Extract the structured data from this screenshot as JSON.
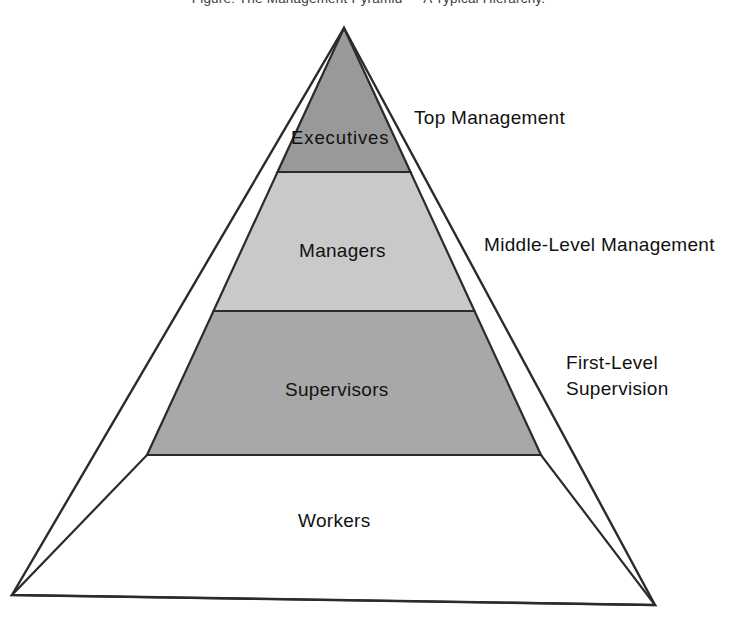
{
  "caption": {
    "text": "Figure: The Management Pyramid — A Typical Hierarchy."
  },
  "diagram": {
    "title": "Management Pyramid",
    "type": "pyramid",
    "apex": {
      "x": 344,
      "y": 28
    },
    "base_left": {
      "x": 12,
      "y": 595
    },
    "base_right": {
      "x": 655,
      "y": 605
    },
    "outline_color": "#2b2b2b",
    "background_color": "#ffffff",
    "levels": [
      {
        "name": "executives",
        "label": "Executives",
        "fill": "#999999",
        "top_y": 28,
        "bottom_y": 172,
        "side_label": "Top Management"
      },
      {
        "name": "managers",
        "label": "Managers",
        "fill": "#c9c9c9",
        "top_y": 172,
        "bottom_y": 311,
        "side_label": "Middle-Level Management"
      },
      {
        "name": "supervisors",
        "label": "Supervisors",
        "fill": "#a8a8a8",
        "top_y": 311,
        "bottom_y": 455,
        "side_label_line1": "First-Level",
        "side_label_line2": "Supervision"
      },
      {
        "name": "workers",
        "label": "Workers",
        "fill": "#ffffff",
        "top_y": 455,
        "bottom_y": 600,
        "side_label": ""
      }
    ]
  }
}
